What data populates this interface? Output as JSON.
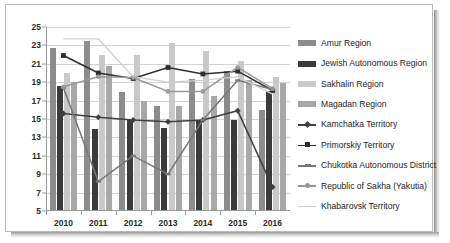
{
  "chart_data": {
    "type": "bar",
    "title": "",
    "xlabel": "",
    "ylabel": "",
    "ylim": [
      5,
      25
    ],
    "ytick_step": 2,
    "yticks": [
      5,
      7,
      9,
      11,
      13,
      15,
      17,
      19,
      21,
      23,
      25
    ],
    "grid": true,
    "legend_position": "right",
    "categories": [
      "2010",
      "2011",
      "2012",
      "2013",
      "2014",
      "2015",
      "2016"
    ],
    "bar_series": [
      {
        "name": "Amur Region",
        "color": "#8c8c8c",
        "values": [
          22.7,
          23.5,
          17.9,
          16.4,
          19.3,
          20.2,
          16.0
        ]
      },
      {
        "name": "Jewish Autonomous Region",
        "color": "#3b3b3b",
        "values": [
          18.6,
          13.9,
          14.9,
          14.0,
          14.9,
          14.9,
          18.0
        ]
      },
      {
        "name": "Sakhalin Region",
        "color": "#c9c9c9",
        "values": [
          20.0,
          22.0,
          22.0,
          23.3,
          22.4,
          21.3,
          19.6
        ]
      },
      {
        "name": "Magadan Region",
        "color": "#a8a8a8",
        "values": [
          19.0,
          20.8,
          17.0,
          16.4,
          17.5,
          19.2,
          18.9
        ]
      }
    ],
    "line_series": [
      {
        "name": "Kamchatka Territory",
        "color": "#3f3f3f",
        "marker": "diamond",
        "values": [
          15.6,
          15.2,
          14.9,
          14.7,
          14.9,
          15.9,
          7.6
        ]
      },
      {
        "name": "Primorskiy Territory",
        "color": "#2e2e2e",
        "marker": "square",
        "values": [
          21.9,
          20.0,
          19.4,
          20.6,
          19.9,
          20.2,
          18.1
        ]
      },
      {
        "name": "Chukotka Autonomous District",
        "color": "#787878",
        "marker": "dash",
        "values": [
          18.4,
          8.2,
          11.0,
          9.0,
          14.9,
          19.2,
          18.2
        ]
      },
      {
        "name": "Republic of Sakha (Yakutia)",
        "color": "#999999",
        "marker": "circle",
        "values": [
          18.5,
          19.6,
          19.5,
          18.0,
          18.0,
          20.6,
          18.3
        ]
      },
      {
        "name": "Khabarovsk Territory",
        "color": "#cfcfcf",
        "marker": "none",
        "values": [
          23.7,
          23.7,
          19.6,
          19.0,
          19.2,
          19.6,
          17.7
        ]
      }
    ]
  }
}
